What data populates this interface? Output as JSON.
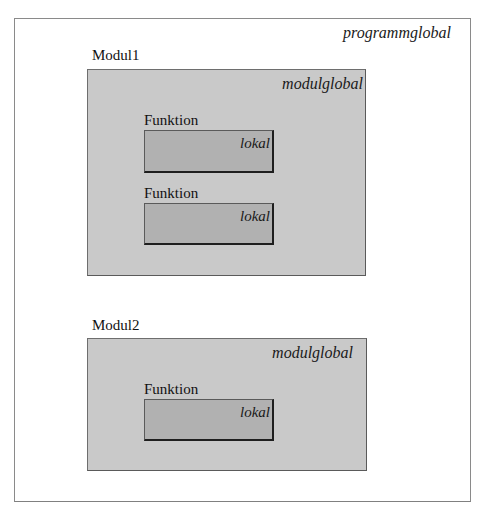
{
  "diagram": {
    "program": {
      "scope_label": "programmglobal"
    },
    "modules": [
      {
        "name": "Modul1",
        "scope_label": "modulglobal",
        "functions": [
          {
            "name": "Funktion",
            "scope_label": "lokal"
          },
          {
            "name": "Funktion",
            "scope_label": "lokal"
          }
        ]
      },
      {
        "name": "Modul2",
        "scope_label": "modulglobal",
        "functions": [
          {
            "name": "Funktion",
            "scope_label": "lokal"
          }
        ]
      }
    ],
    "colors": {
      "program_fill": "#ffffff",
      "module_fill": "#c9c9c9",
      "function_fill": "#b1b1b1",
      "border": "#5a5a5a"
    }
  }
}
